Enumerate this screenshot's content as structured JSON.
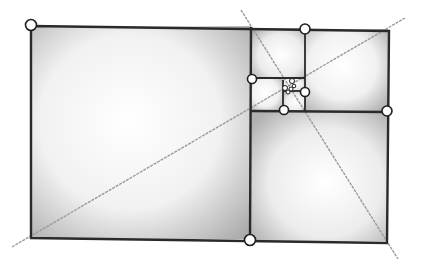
{
  "diagram": {
    "colors": {
      "background": "#ffffff",
      "edge": "#2a2a2a",
      "diagonal": "#9a9a9a",
      "fill_dark": "#a8a8a8",
      "fill_light": "#ffffff",
      "node_fill": "#ffffff",
      "node_stroke": "#1e1e1e"
    },
    "rectangles": [
      {
        "name": "large-square",
        "x": 31,
        "y": 26,
        "w": 220,
        "h": 213
      },
      {
        "name": "right-bottom-square",
        "x": 251,
        "y": 111,
        "w": 136,
        "h": 130
      },
      {
        "name": "right-top-square",
        "x": 305,
        "y": 29,
        "w": 83,
        "h": 82
      },
      {
        "name": "upper-left-square",
        "x": 251,
        "y": 28,
        "w": 54,
        "h": 50
      },
      {
        "name": "small-square-a",
        "x": 251,
        "y": 78,
        "w": 32,
        "h": 33
      },
      {
        "name": "small-square-b",
        "x": 283,
        "y": 91,
        "w": 22,
        "h": 20
      },
      {
        "name": "small-square-c",
        "x": 283,
        "y": 78,
        "w": 22,
        "h": 13
      }
    ],
    "outline": [
      [
        31,
        26
      ],
      [
        389,
        31
      ],
      [
        387,
        243
      ],
      [
        31,
        238
      ]
    ],
    "edges": [
      [
        [
          251,
          27
        ],
        [
          250,
          240
        ]
      ],
      [
        [
          251,
          111
        ],
        [
          387,
          112
        ]
      ],
      [
        [
          305,
          29
        ],
        [
          305,
          111
        ]
      ],
      [
        [
          251,
          78
        ],
        [
          305,
          78
        ]
      ],
      [
        [
          283,
          80
        ],
        [
          283,
          111
        ]
      ],
      [
        [
          283,
          91
        ],
        [
          305,
          91
        ]
      ]
    ],
    "diagonals": [
      {
        "name": "diagonal-long",
        "from": [
          12,
          247
        ],
        "to": [
          405,
          18
        ]
      },
      {
        "name": "diagonal-short",
        "from": [
          241,
          10
        ],
        "to": [
          398,
          259
        ]
      }
    ],
    "nodes": [
      {
        "name": "node-top-left",
        "x": 31,
        "y": 25,
        "r": 5.5
      },
      {
        "name": "node-top-mid",
        "x": 305,
        "y": 29,
        "r": 5
      },
      {
        "name": "node-left-mid",
        "x": 252,
        "y": 79,
        "r": 4.5
      },
      {
        "name": "node-inner-right",
        "x": 305,
        "y": 92,
        "r": 4.5
      },
      {
        "name": "node-inner-bottom",
        "x": 284,
        "y": 110,
        "r": 4.5
      },
      {
        "name": "node-right-mid",
        "x": 387,
        "y": 111,
        "r": 5
      },
      {
        "name": "node-bottom-mid",
        "x": 250,
        "y": 240,
        "r": 5.5
      },
      {
        "name": "node-tiny-1",
        "x": 292,
        "y": 81,
        "r": 2.5
      },
      {
        "name": "node-tiny-2",
        "x": 285,
        "y": 88,
        "r": 2.5
      },
      {
        "name": "node-tiny-3",
        "x": 291,
        "y": 89,
        "r": 2
      },
      {
        "name": "node-tiny-4",
        "x": 288,
        "y": 92,
        "r": 2
      },
      {
        "name": "node-tiny-5",
        "x": 294,
        "y": 86,
        "r": 1.8
      }
    ]
  }
}
